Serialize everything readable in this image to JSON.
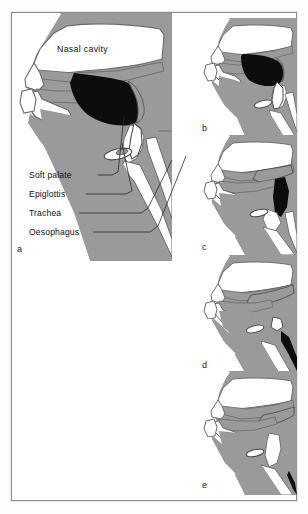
{
  "figure": {
    "title_hidden": "",
    "border_color": "#8d8d8d",
    "background_color": "#ffffff"
  },
  "colors": {
    "tissue_gray": "#9a9a9a",
    "tissue_gray_light": "#a8a8a8",
    "outline": "#5e5e5e",
    "air_white": "#ffffff",
    "bolus_black": "#0d0d0d",
    "text": "#111111",
    "leader_line": "#2a2a2a"
  },
  "panels": [
    {
      "id": "a",
      "letter": "a",
      "letter_x": 16,
      "letter_y": 246,
      "description": "Sagittal section of head and neck at rest with bolus in mouth"
    },
    {
      "id": "b",
      "letter": "b",
      "letter_x": 198,
      "letter_y": 128,
      "description": "Bolus pushed to back of mouth by tongue"
    },
    {
      "id": "c",
      "letter": "c",
      "letter_x": 198,
      "letter_y": 248,
      "description": "Bolus in pharynx, soft palate raised"
    },
    {
      "id": "d",
      "letter": "d",
      "letter_x": 198,
      "letter_y": 363,
      "description": "Bolus entering oesophagus, epiglottis closed"
    },
    {
      "id": "e",
      "letter": "e",
      "letter_x": 198,
      "letter_y": 479,
      "description": "Structures returned to resting position"
    }
  ],
  "labels": {
    "nasal_cavity": {
      "text": "Nasal cavity",
      "x": 57,
      "y": 48
    },
    "callouts": [
      {
        "text": "Soft palate",
        "x": 29,
        "y": 171
      },
      {
        "text": "Epiglottis",
        "x": 29,
        "y": 190
      },
      {
        "text": "Trachea",
        "x": 29,
        "y": 209
      },
      {
        "text": "Oesophagus",
        "x": 29,
        "y": 228
      }
    ]
  },
  "leader_lines": [
    {
      "name": "soft-palate-leader",
      "points": "98,175 112,175 118,172 124,116"
    },
    {
      "name": "epiglottis-leader",
      "points": "86,194 126,194 132,191 122,143"
    },
    {
      "name": "trachea-leader",
      "points": "79,213 141,213 148,208 172,160"
    },
    {
      "name": "oesophagus-leader",
      "points": "93,232 150,232 158,226 186,156"
    }
  ]
}
